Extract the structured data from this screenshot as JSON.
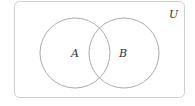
{
  "diagram": {
    "type": "venn",
    "universe_label": "U",
    "sets": [
      {
        "label": "A",
        "cx": 75,
        "cy": 53,
        "r": 35
      },
      {
        "label": "B",
        "cx": 124,
        "cy": 53,
        "r": 35
      }
    ],
    "colors": {
      "universe_border": "#cfcfcf",
      "circle_stroke": "#ababab",
      "text": "#333333"
    }
  }
}
